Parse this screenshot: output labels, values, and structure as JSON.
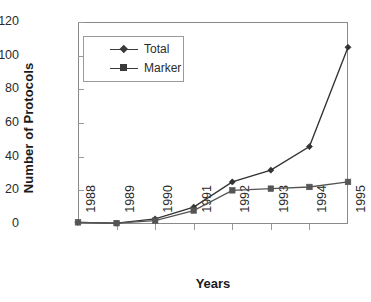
{
  "chart_data": {
    "type": "line",
    "title": "",
    "xlabel": "Years",
    "ylabel": "Number of Protocols",
    "categories": [
      "1988",
      "1989",
      "1990",
      "1991",
      "1992",
      "1993",
      "1994",
      "1995"
    ],
    "x": [
      1988,
      1989,
      1990,
      1991,
      1992,
      1993,
      1994,
      1995
    ],
    "series": [
      {
        "name": "Total",
        "marker": "diamond",
        "color": "#333333",
        "values": [
          1,
          0.5,
          3,
          10,
          25,
          32,
          46,
          105
        ]
      },
      {
        "name": "Marker",
        "marker": "square",
        "color": "#555555",
        "values": [
          1,
          0.5,
          2,
          8,
          20,
          21,
          22,
          25
        ]
      }
    ],
    "ylim": [
      0,
      120
    ],
    "yticks": [
      0,
      20,
      40,
      60,
      80,
      100,
      120
    ],
    "ytick_labels": [
      "0",
      "20",
      "40",
      "60",
      "80",
      "100",
      "120"
    ],
    "grid": false,
    "legend_position": "upper-left-inside"
  },
  "axes": {
    "y_title": "Number of Protocols",
    "x_title": "Years"
  },
  "legend": {
    "entries": [
      {
        "label": "Total"
      },
      {
        "label": "Marker"
      }
    ]
  },
  "colors": {
    "line_total": "#333333",
    "line_marker": "#555555",
    "frame": "#8a8a8a",
    "text": "#2b2b2b",
    "background": "#ffffff"
  }
}
